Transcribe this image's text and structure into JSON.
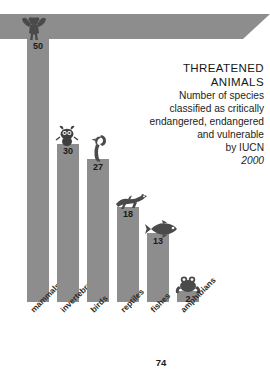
{
  "page": {
    "number": "74",
    "background_color": "#ffffff",
    "bar_color": "#8d8d8d",
    "text_color": "#1d1d1d"
  },
  "title_block": {
    "line1": "THREATENED",
    "line2": "ANIMALS",
    "line3": "Number of species",
    "line4": "classified as critically",
    "line5": "endangered, endangered",
    "line6": "and vulnerable",
    "line7": "by IUCN",
    "year": "2000"
  },
  "chart_data": {
    "type": "bar",
    "title": "THREATENED ANIMALS",
    "subtitle": "Number of species classified as critically endangered, endangered and vulnerable by IUCN 2000",
    "xlabel": "",
    "ylabel": "",
    "ylim": [
      0,
      50
    ],
    "grid": false,
    "legend": "none",
    "orientation": "vertical",
    "categories": [
      "mammals",
      "invertebrates",
      "birds",
      "reptiles",
      "fishes",
      "amphibians"
    ],
    "values": [
      50,
      30,
      27,
      18,
      13,
      2
    ],
    "value_labels": [
      "50",
      "30",
      "27",
      "18",
      "13",
      "2"
    ],
    "icons": [
      "monkey-icon",
      "insect-icon",
      "bird-icon",
      "lizard-icon",
      "fish-icon",
      "frog-icon"
    ],
    "units": "species"
  }
}
